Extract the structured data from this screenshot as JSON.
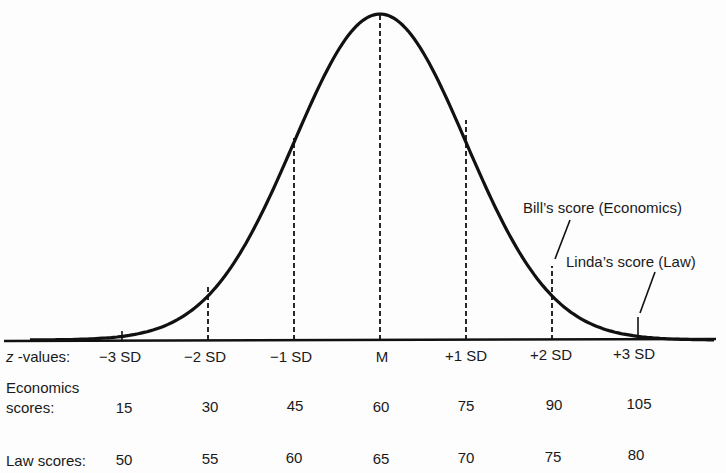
{
  "diagram": {
    "type": "normal-distribution",
    "row_labels": {
      "z": "-values:",
      "z_italic": "z",
      "economics_line1": "Economics",
      "economics_line2": "scores:",
      "law": "Law scores:"
    },
    "columns": [
      {
        "z": "−3 SD",
        "economics": "15",
        "law": "50"
      },
      {
        "z": "−2 SD",
        "economics": "30",
        "law": "55"
      },
      {
        "z": "−1 SD",
        "economics": "45",
        "law": "60"
      },
      {
        "z": "M",
        "economics": "60",
        "law": "65"
      },
      {
        "z": "+1 SD",
        "economics": "75",
        "law": "70"
      },
      {
        "z": "+2 SD",
        "economics": "90",
        "law": "75"
      },
      {
        "z": "+3 SD",
        "economics": "105",
        "law": "80"
      }
    ],
    "annotations": {
      "bill": "Bill’s score (Economics)",
      "linda": "Linda’s score (Law)"
    },
    "colors": {
      "line": "#111111",
      "background": "#fdfdfd"
    }
  }
}
